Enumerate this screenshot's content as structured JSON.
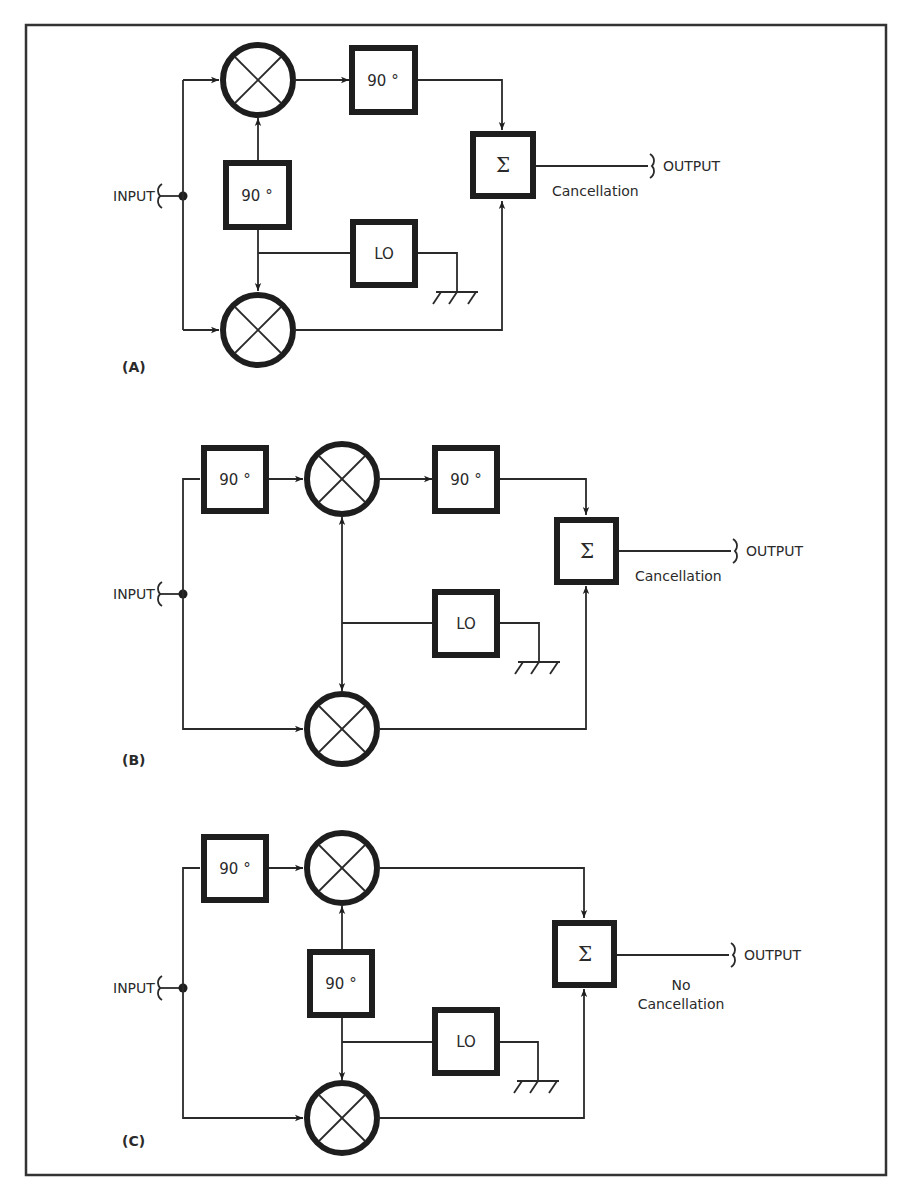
{
  "figure": {
    "title": "",
    "frame_color": "#333333",
    "line_color": "#2a2a2a"
  },
  "diagrams": [
    {
      "id": "A",
      "tag": "(A)",
      "input_label": "INPUT",
      "output_label": "OUTPUT",
      "result_line1": "Cancellation",
      "result_line2": "",
      "blocks": {
        "phase_top": "90 °",
        "phase_lo": "90 °",
        "lo": "LO",
        "sum": "Σ"
      }
    },
    {
      "id": "B",
      "tag": "(B)",
      "input_label": "INPUT",
      "output_label": "OUTPUT",
      "result_line1": "Cancellation",
      "result_line2": "",
      "blocks": {
        "phase_in": "90 °",
        "phase_top": "90 °",
        "lo": "LO",
        "sum": "Σ"
      }
    },
    {
      "id": "C",
      "tag": "(C)",
      "input_label": "INPUT",
      "output_label": "OUTPUT",
      "result_line1": "No",
      "result_line2": "Cancellation",
      "blocks": {
        "phase_in": "90 °",
        "phase_lo": "90 °",
        "lo": "LO",
        "sum": "Σ"
      }
    }
  ]
}
